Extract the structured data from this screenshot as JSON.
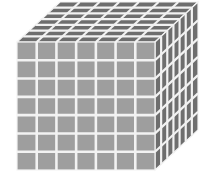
{
  "figure": {
    "object_name": "cube",
    "projection": "oblique",
    "caption": ""
  },
  "geometry": {
    "divisions_per_edge": 7,
    "front_face": {
      "rows": 7,
      "columns": 7,
      "cells": 49,
      "origin_x": 17,
      "origin_y": 42,
      "width": 138,
      "height": 128
    },
    "top_face": {
      "rows": 7,
      "columns": 7,
      "cells": 49
    },
    "right_face": {
      "rows": 7,
      "columns": 7,
      "cells": 49
    },
    "depth_offset_x": 43,
    "depth_offset_y": -40,
    "total_unit_cubes": 343
  },
  "colors": {
    "background": "#ffffff",
    "front_face": "#9e9e9e",
    "top_face": "#6e6e6e",
    "right_face": "#6e6e6e",
    "gridline": "#f2f2f2"
  },
  "labels": {
    "front_face": "front-face",
    "top_face": "top-face",
    "right_face": "right-face"
  }
}
